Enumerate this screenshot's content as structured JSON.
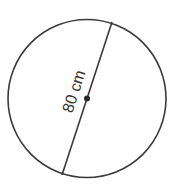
{
  "diagram": {
    "shape": "circle",
    "diameter_label": "80 cm",
    "colors": {
      "stroke": "#3a3a3a",
      "background": "#ffffff",
      "center_dot": "#2a2a2a"
    }
  }
}
